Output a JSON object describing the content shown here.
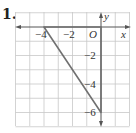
{
  "problem": {
    "number": "1."
  },
  "axes": {
    "x_label": "x",
    "y_label": "y",
    "origin_label": "O",
    "x_ticks": [
      {
        "value": -4,
        "label": "−4"
      },
      {
        "value": -2,
        "label": "−2"
      }
    ],
    "y_ticks": [
      {
        "value": -2,
        "label": "−2"
      },
      {
        "value": -4,
        "label": "−4"
      },
      {
        "value": -6,
        "label": "−6"
      }
    ],
    "grid": {
      "x_min": -6,
      "x_max": 2,
      "y_min": -7,
      "y_max": 1,
      "step": 1
    }
  },
  "triangle": {
    "vertices": [
      {
        "x": -4,
        "y": 0
      },
      {
        "x": 0,
        "y": 0
      },
      {
        "x": 0,
        "y": -6
      }
    ],
    "stroke_color": "#707070"
  },
  "colors": {
    "grid": "#c8c8c8",
    "axis": "#555555",
    "triangle": "#707070"
  }
}
